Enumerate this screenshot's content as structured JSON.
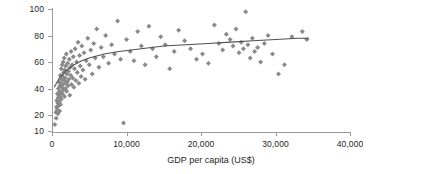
{
  "chart_data": {
    "type": "scatter",
    "title": "",
    "xlabel": "GDP per capita (US$)",
    "ylabel": "urban (%)",
    "xlim": [
      0,
      40000
    ],
    "ylim": [
      10,
      100
    ],
    "grid": false,
    "legend": null,
    "xticks": [
      0,
      10000,
      20000,
      30000,
      40000
    ],
    "xticklabels": [
      "0",
      "10,000",
      "20,000",
      "30,000",
      "40,000"
    ],
    "yticks": [
      10,
      20,
      40,
      60,
      80,
      100
    ],
    "yticklabels": [
      "10",
      "20",
      "40",
      "60",
      "80",
      "100"
    ],
    "y_axis_note": "non-uniform: 20-100 evenly spaced, 10 compressed below 20",
    "marker": "diamond",
    "marker_color": "#8a8a8a",
    "trendline_color": "#4f4f4f",
    "axis_color": "#9a9a9a",
    "series": [
      {
        "name": "countries",
        "points": [
          [
            380,
            14
          ],
          [
            520,
            22
          ],
          [
            560,
            18
          ],
          [
            600,
            26
          ],
          [
            640,
            31
          ],
          [
            700,
            24
          ],
          [
            720,
            36
          ],
          [
            760,
            29
          ],
          [
            800,
            21
          ],
          [
            830,
            33
          ],
          [
            860,
            40
          ],
          [
            900,
            27
          ],
          [
            930,
            35
          ],
          [
            960,
            45
          ],
          [
            980,
            30
          ],
          [
            1000,
            38
          ],
          [
            1020,
            23
          ],
          [
            1060,
            42
          ],
          [
            1090,
            34
          ],
          [
            1120,
            50
          ],
          [
            1150,
            28
          ],
          [
            1180,
            44
          ],
          [
            1200,
            37
          ],
          [
            1240,
            55
          ],
          [
            1270,
            32
          ],
          [
            1300,
            47
          ],
          [
            1330,
            41
          ],
          [
            1360,
            58
          ],
          [
            1400,
            36
          ],
          [
            1430,
            49
          ],
          [
            1460,
            43
          ],
          [
            1500,
            60
          ],
          [
            1530,
            39
          ],
          [
            1560,
            52
          ],
          [
            1600,
            46
          ],
          [
            1640,
            63
          ],
          [
            1680,
            34
          ],
          [
            1720,
            54
          ],
          [
            1760,
            48
          ],
          [
            1800,
            40
          ],
          [
            1840,
            57
          ],
          [
            1880,
            44
          ],
          [
            1920,
            66
          ],
          [
            1960,
            38
          ],
          [
            2000,
            51
          ],
          [
            2050,
            45
          ],
          [
            2100,
            59
          ],
          [
            2150,
            42
          ],
          [
            2200,
            53
          ],
          [
            2260,
            47
          ],
          [
            2320,
            62
          ],
          [
            2380,
            35
          ],
          [
            2440,
            56
          ],
          [
            2500,
            50
          ],
          [
            2560,
            68
          ],
          [
            2620,
            43
          ],
          [
            2700,
            58
          ],
          [
            2780,
            48
          ],
          [
            2860,
            64
          ],
          [
            2940,
            41
          ],
          [
            3020,
            55
          ],
          [
            3100,
            70
          ],
          [
            3200,
            46
          ],
          [
            3300,
            60
          ],
          [
            3400,
            52
          ],
          [
            3500,
            75
          ],
          [
            3600,
            44
          ],
          [
            3700,
            65
          ],
          [
            3800,
            57
          ],
          [
            3900,
            49
          ],
          [
            4000,
            72
          ],
          [
            4150,
            54
          ],
          [
            4300,
            67
          ],
          [
            4450,
            47
          ],
          [
            4600,
            61
          ],
          [
            4800,
            78
          ],
          [
            5000,
            58
          ],
          [
            5200,
            69
          ],
          [
            5400,
            51
          ],
          [
            5600,
            74
          ],
          [
            5800,
            63
          ],
          [
            6000,
            85
          ],
          [
            6300,
            56
          ],
          [
            6600,
            71
          ],
          [
            6900,
            64
          ],
          [
            7200,
            80
          ],
          [
            7600,
            59
          ],
          [
            8000,
            73
          ],
          [
            8400,
            66
          ],
          [
            8800,
            91
          ],
          [
            9200,
            62
          ],
          [
            9600,
            15
          ],
          [
            10000,
            77
          ],
          [
            10500,
            68
          ],
          [
            11000,
            61
          ],
          [
            11500,
            83
          ],
          [
            12000,
            72
          ],
          [
            12500,
            58
          ],
          [
            13000,
            87
          ],
          [
            13500,
            70
          ],
          [
            14000,
            64
          ],
          [
            14600,
            79
          ],
          [
            15200,
            73
          ],
          [
            15800,
            55
          ],
          [
            16400,
            68
          ],
          [
            17000,
            84
          ],
          [
            17800,
            76
          ],
          [
            18600,
            70
          ],
          [
            19400,
            62
          ],
          [
            20200,
            66
          ],
          [
            21000,
            59
          ],
          [
            21800,
            88
          ],
          [
            22400,
            74
          ],
          [
            22900,
            69
          ],
          [
            23400,
            81
          ],
          [
            23900,
            77
          ],
          [
            24300,
            72
          ],
          [
            24700,
            85
          ],
          [
            25100,
            67
          ],
          [
            25400,
            75
          ],
          [
            25700,
            70
          ],
          [
            26000,
            98
          ],
          [
            26300,
            73
          ],
          [
            26600,
            63
          ],
          [
            26900,
            78
          ],
          [
            27200,
            68
          ],
          [
            27600,
            71
          ],
          [
            28000,
            60
          ],
          [
            28500,
            74
          ],
          [
            29000,
            80
          ],
          [
            29600,
            66
          ],
          [
            30400,
            51
          ],
          [
            31200,
            58
          ],
          [
            32200,
            79
          ],
          [
            33600,
            83
          ],
          [
            34200,
            77
          ]
        ]
      }
    ],
    "trendline": {
      "description": "smooth logarithmic fit rising from ~40% at low GDP to ~78% at 34,000",
      "points": [
        [
          300,
          41
        ],
        [
          1000,
          48
        ],
        [
          2000,
          54
        ],
        [
          3000,
          58
        ],
        [
          4000,
          61
        ],
        [
          5000,
          63
        ],
        [
          7000,
          66
        ],
        [
          9000,
          68
        ],
        [
          12000,
          70
        ],
        [
          15000,
          72
        ],
        [
          18000,
          73
        ],
        [
          21000,
          74
        ],
        [
          24000,
          75
        ],
        [
          27000,
          76
        ],
        [
          30000,
          77
        ],
        [
          33000,
          78
        ],
        [
          34500,
          78
        ]
      ]
    }
  }
}
